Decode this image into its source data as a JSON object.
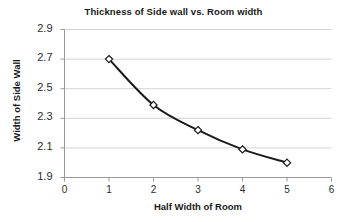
{
  "chart_data": {
    "type": "line",
    "title": "Thickness of Side wall vs. Room width",
    "xlabel": "Half Width of Room",
    "ylabel": "Width of Side Wall",
    "x": [
      1,
      2,
      3,
      4,
      5
    ],
    "values": [
      2.7,
      2.39,
      2.22,
      2.09,
      2.0
    ],
    "series": [
      {
        "name": "Thickness of Side wall",
        "x": [
          1,
          2,
          3,
          4,
          5
        ],
        "values": [
          2.7,
          2.39,
          2.22,
          2.09,
          2.0
        ]
      }
    ],
    "xlim": [
      0,
      6
    ],
    "ylim": [
      1.9,
      2.9
    ],
    "xticks": [
      "0",
      "1",
      "2",
      "3",
      "4",
      "5",
      "6"
    ],
    "yticks": [
      "1.9",
      "2.1",
      "2.3",
      "2.5",
      "2.7",
      "2.9"
    ],
    "grid": "horizontal",
    "legend": "none",
    "marker": "diamond",
    "line_color": "#1a1a1a",
    "marker_fill": "#ffffff",
    "marker_stroke": "#1a1a1a",
    "grid_color": "#d4d4d4",
    "axis_color": "#9a9a9a",
    "background": "#ffffff"
  }
}
